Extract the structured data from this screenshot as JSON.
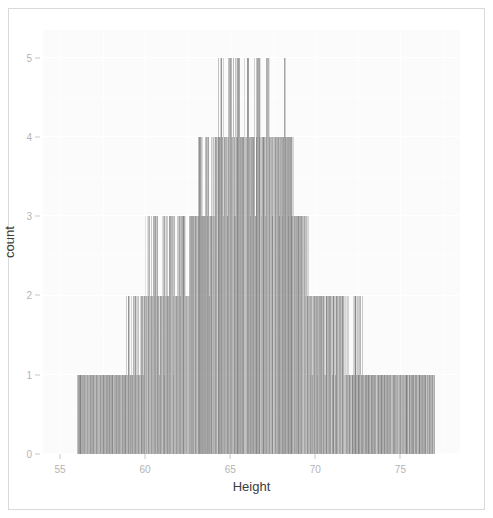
{
  "figure": {
    "background_color": "#ffffff",
    "panel_color": "#fbfbfb",
    "bar_color": "#3a3a3a",
    "axis_text_color": "#b4b4b4",
    "axis_title_color": "#3c3c3c",
    "frame_border_color": "#d9d9d9"
  },
  "chart_data": {
    "type": "bar",
    "title": "",
    "subtitle": "",
    "xlabel": "Height",
    "ylabel": "count",
    "xlim": [
      54.0,
      78.5
    ],
    "ylim": [
      0,
      5.35
    ],
    "xticks": [
      55,
      60,
      65,
      70,
      75
    ],
    "xticklabels": [
      "55",
      "60",
      "65",
      "70",
      "75"
    ],
    "yticks": [
      0,
      1,
      2,
      3,
      4,
      5
    ],
    "yticklabels": [
      "0",
      "1",
      "2",
      "3",
      "4",
      "5"
    ],
    "grid": true,
    "grid_color": "#ffffff",
    "legend": "none",
    "orientation": "vertical",
    "binwidth": 0.0254,
    "note": "Bars are drawn from a compact per-bin count list: x = bin center (inches), y = count in that bin.",
    "categories": [
      56.0,
      56.3,
      56.6,
      57.0,
      57.3,
      57.6,
      58.0,
      58.2,
      58.5,
      58.8,
      59.0,
      59.2,
      59.4,
      59.6,
      59.8,
      60.0,
      60.2,
      60.4,
      60.6,
      60.8,
      61.0,
      61.2,
      61.4,
      61.6,
      61.8,
      62.0,
      62.2,
      62.4,
      62.6,
      62.8,
      63.0,
      63.2,
      63.4,
      63.6,
      63.8,
      64.0,
      64.2,
      64.4,
      64.6,
      64.8,
      65.0,
      65.2,
      65.4,
      65.6,
      65.8,
      66.0,
      66.2,
      66.4,
      66.6,
      66.8,
      67.0,
      67.2,
      67.4,
      67.6,
      67.8,
      68.0,
      68.2,
      68.4,
      68.6,
      68.8,
      69.0,
      69.2,
      69.4,
      69.6,
      69.8,
      70.0,
      70.3,
      70.6,
      71.0,
      71.3,
      71.6,
      72.0,
      72.4,
      72.8,
      73.2,
      73.6,
      74.0,
      74.5,
      75.0,
      75.5,
      76.0,
      76.5,
      77.0
    ],
    "values": [
      1,
      1,
      1,
      1,
      1,
      1,
      1,
      1,
      1,
      1,
      2,
      1,
      2,
      1,
      2,
      2,
      3,
      2,
      3,
      2,
      3,
      2,
      3,
      3,
      2,
      3,
      3,
      2,
      3,
      3,
      3,
      4,
      3,
      4,
      3,
      4,
      4,
      5,
      4,
      4,
      5,
      4,
      5,
      4,
      4,
      5,
      4,
      4,
      5,
      4,
      4,
      5,
      4,
      4,
      4,
      4,
      5,
      4,
      4,
      3,
      3,
      3,
      3,
      2,
      2,
      2,
      2,
      2,
      2,
      2,
      2,
      1,
      2,
      1,
      1,
      1,
      1,
      1,
      1,
      1,
      1,
      1,
      1
    ],
    "band_summary": [
      {
        "count_level": 1,
        "x_start": 56.0,
        "x_end": 77.0
      },
      {
        "count_level": 2,
        "x_start": 59.5,
        "x_end": 74.5
      },
      {
        "count_level": 3,
        "x_start": 60.5,
        "x_end": 69.6
      },
      {
        "count_level": 4,
        "x_start": 63.4,
        "x_end": 69.4
      },
      {
        "count_level": 5,
        "x_start": 64.0,
        "x_end": 69.1
      }
    ]
  }
}
